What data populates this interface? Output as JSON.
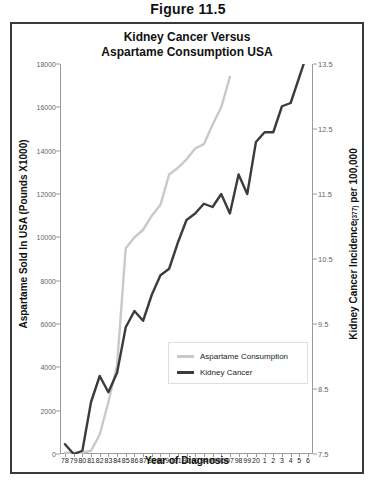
{
  "figure_caption": "Figure 11.5",
  "chart_title_line1": "Kidney Cancer Versus",
  "chart_title_line2": "Aspartame Consumption USA",
  "axis": {
    "ylabel_left": "Aspartame Sold In USA (Pounds X1000)",
    "ylabel_right_main": "Kidney Cancer Incidence",
    "ylabel_right_sup": "(377)",
    "ylabel_right_tail": " per 100,000",
    "xlabel": "Year of Diagnosis"
  },
  "legend": {
    "items": [
      {
        "label": "Aspartame Consumption",
        "color": "#c9c9c9"
      },
      {
        "label": "Kidney Cancer",
        "color": "#3b3b3b"
      }
    ]
  },
  "colors": {
    "aspartame": "#c9c9c9",
    "kidney": "#3b3b3b",
    "axis": "#9a9a9a",
    "border": "#3a3a3a"
  },
  "chart_data": {
    "type": "line",
    "title": "Kidney Cancer Versus Aspartame Consumption USA",
    "xlabel": "Year of Diagnosis",
    "grid": false,
    "legend_position": "inside-bottom-right",
    "categories": [
      "78",
      "79",
      "80",
      "81",
      "82",
      "83",
      "84",
      "85",
      "86",
      "87",
      "88",
      "89",
      "90",
      "91",
      "92",
      "93",
      "94",
      "95",
      "96",
      "97",
      "98",
      "99",
      "20",
      "1",
      "2",
      "3",
      "4",
      "5",
      "6"
    ],
    "yaxis_left": {
      "label": "Aspartame Sold In USA (Pounds X1000)",
      "ticks": [
        0,
        2000,
        4000,
        6000,
        8000,
        10000,
        12000,
        14000,
        16000,
        18000
      ],
      "ylim": [
        0,
        18000
      ]
    },
    "yaxis_right": {
      "label": "Kidney Cancer Incidence(377) per 100,000",
      "ticks": [
        7.5,
        8.5,
        9.5,
        10.5,
        11.5,
        12.5,
        13.5
      ],
      "ylim": [
        7.5,
        13.5
      ]
    },
    "series": [
      {
        "name": "Aspartame Consumption",
        "axis": "left",
        "color": "#c9c9c9",
        "values": [
          60,
          60,
          60,
          150,
          900,
          2400,
          4100,
          9500,
          10000,
          10350,
          11000,
          11500,
          12900,
          13200,
          13600,
          14100,
          14300,
          15200,
          16000,
          17400,
          null,
          null,
          null,
          null,
          null,
          null,
          null,
          null,
          null
        ]
      },
      {
        "name": "Kidney Cancer",
        "axis": "right",
        "color": "#3b3b3b",
        "values": [
          7.65,
          7.5,
          7.55,
          8.3,
          8.7,
          8.45,
          8.75,
          9.45,
          9.7,
          9.55,
          9.95,
          10.25,
          10.35,
          10.75,
          11.1,
          11.2,
          11.35,
          11.3,
          11.5,
          11.2,
          11.8,
          11.5,
          12.3,
          12.45,
          12.45,
          12.85,
          12.9,
          13.3,
          13.7
        ]
      }
    ]
  }
}
